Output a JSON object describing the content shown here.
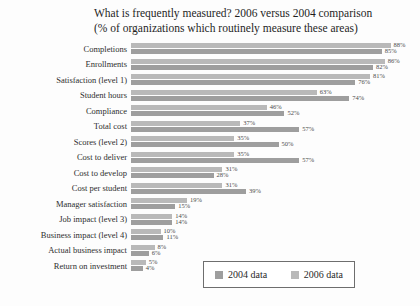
{
  "title": "What is frequently measured? 2006 versus 2004 comparison",
  "subtitle": "(% of organizations which routinely measure these areas)",
  "legend": {
    "label_2004": "2004 data",
    "label_2006": "2006 data"
  },
  "colors": {
    "bar_2006": "#b9b9b9",
    "bar_2004": "#9e9e9e",
    "legend_border": "#6e6e6e"
  },
  "chart_data": {
    "type": "bar",
    "orientation": "horizontal",
    "title": "What is frequently measured? 2006 versus 2004 comparison",
    "subtitle": "(% of organizations which routinely measure these areas)",
    "xlabel": "",
    "ylabel": "",
    "xlim": [
      0,
      100
    ],
    "grid": false,
    "legend_position": "bottom-right",
    "value_suffix": "%",
    "categories": [
      "Completions",
      "Enrollments",
      "Satisfaction (level 1)",
      "Student hours",
      "Compliance",
      "Total cost",
      "Scores (level 2)",
      "Cost to deliver",
      "Cost to develop",
      "Cost per student",
      "Manager satisfaction",
      "Job impact (level 3)",
      "Business impact (level 4)",
      "Actual business impact",
      "Return on investment"
    ],
    "series": [
      {
        "name": "2006 data",
        "values": [
          88,
          86,
          81,
          63,
          46,
          37,
          35,
          35,
          31,
          31,
          19,
          14,
          10,
          8,
          5
        ]
      },
      {
        "name": "2004 data",
        "values": [
          85,
          82,
          76,
          74,
          52,
          57,
          50,
          57,
          28,
          39,
          15,
          14,
          11,
          6,
          4
        ]
      }
    ]
  }
}
